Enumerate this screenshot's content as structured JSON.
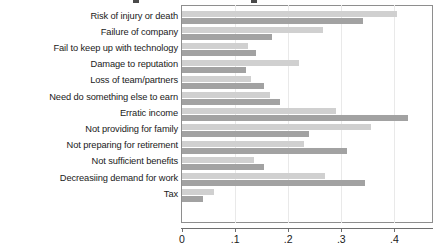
{
  "chart_data": {
    "type": "bar",
    "orientation": "horizontal",
    "title": "",
    "xlabel": "",
    "ylabel": "",
    "xlim": [
      0,
      0.46
    ],
    "grid": true,
    "legend": null,
    "xticks": [
      "0",
      ".1",
      ".2",
      ".3",
      ".4"
    ],
    "xtick_values": [
      0,
      0.1,
      0.2,
      0.3,
      0.4
    ],
    "categories": [
      "Risk of injury or death",
      "Failure of company",
      "Fail to keep up with technology",
      "Damage to reputation",
      "Loss of team/partners",
      "Need do something else to earn",
      "Erratic income",
      "Not providing for family",
      "Not preparing for retirement",
      "Not sufficient benefits",
      "Decreasiing demand for work",
      "Tax"
    ],
    "series": [
      {
        "name": "series-light",
        "color": "#d0d0d0",
        "values": [
          0.405,
          0.265,
          0.125,
          0.22,
          0.13,
          0.165,
          0.29,
          0.355,
          0.23,
          0.135,
          0.27,
          0.06
        ]
      },
      {
        "name": "series-dark",
        "color": "#a2a2a2",
        "values": [
          0.34,
          0.17,
          0.14,
          0.12,
          0.155,
          0.185,
          0.425,
          0.24,
          0.31,
          0.155,
          0.345,
          0.04
        ]
      }
    ]
  },
  "colors": {
    "light_bar": "#d0d0d0",
    "dark_bar": "#a2a2a2",
    "axis": "#6f6f6f",
    "frame": "#8e8e8e",
    "grid": "#e9e9e9",
    "text": "#1a1a1a",
    "background": "#ffffff"
  }
}
